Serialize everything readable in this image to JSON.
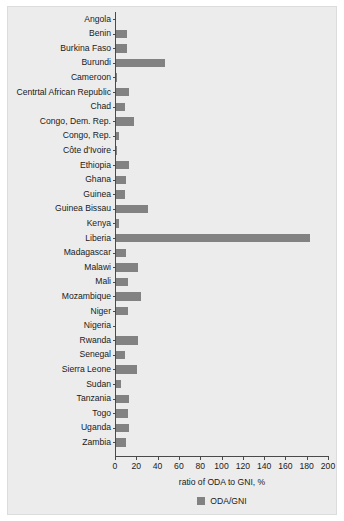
{
  "chart_data": {
    "type": "bar",
    "orientation": "horizontal",
    "title": "",
    "xlabel": "ratio of ODA to GNI, %",
    "ylabel": "",
    "xlim": [
      0,
      200
    ],
    "xticks": [
      0,
      20,
      40,
      60,
      80,
      100,
      120,
      140,
      160,
      180,
      200
    ],
    "grid": false,
    "legend": {
      "position": "bottom",
      "entries": [
        {
          "name": "ODA/GNI",
          "color": "#828282"
        }
      ]
    },
    "series": [
      {
        "name": "ODA/GNI",
        "color": "#828282",
        "values": [
          1,
          11,
          11,
          47,
          2,
          13,
          9,
          18,
          4,
          2,
          13,
          10,
          9,
          31,
          4,
          183,
          10,
          22,
          12,
          24,
          12,
          1,
          22,
          9,
          21,
          6,
          13,
          12,
          13,
          10
        ]
      }
    ],
    "categories": [
      "Angola",
      "Benin",
      "Burkina Faso",
      "Burundi",
      "Cameroon",
      "Centrtal African Republic",
      "Chad",
      "Congo, Dem. Rep.",
      "Congo, Rep.",
      "Côte d'Ivoire",
      "Ethiopia",
      "Ghana",
      "Guinea",
      "Guinea Bissau",
      "Kenya",
      "Liberia",
      "Madagascar",
      "Malawi",
      "Mali",
      "Mozambique",
      "Niger",
      "Nigeria",
      "Rwanda",
      "Senegal",
      "Sierra Leone",
      "Sudan",
      "Tanzania",
      "Togo",
      "Uganda",
      "Zambia"
    ]
  },
  "colors": {
    "bar": "#828282",
    "panel_background": "#ececec",
    "figure_background": "#ffffff",
    "axis": "#4a4a4a",
    "text": "#1a1a1a"
  }
}
